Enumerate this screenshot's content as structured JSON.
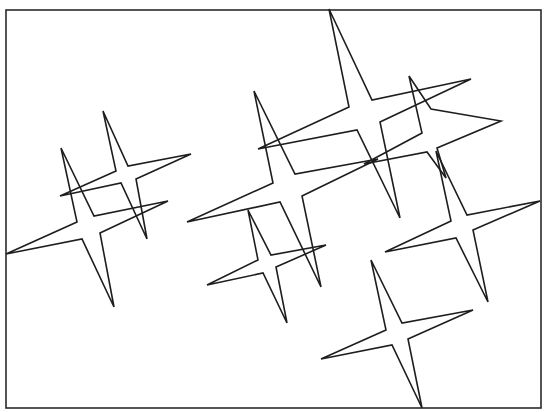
{
  "caption": "",
  "frame": {
    "x": 6,
    "y": 10,
    "width": 535,
    "height": 398,
    "stroke": "#2a2a2a"
  },
  "stroke_color": "#1e1e1e",
  "stars": [
    {
      "id": "star-a",
      "points": [
        [
          61,
          148
        ],
        [
          77,
          222
        ],
        [
          6,
          254
        ],
        [
          82,
          239
        ],
        [
          114,
          307
        ],
        [
          100,
          233
        ],
        [
          168,
          201
        ],
        [
          94,
          216
        ]
      ]
    },
    {
      "id": "star-b",
      "points": [
        [
          103,
          111
        ],
        [
          116,
          171
        ],
        [
          60,
          196
        ],
        [
          121,
          183
        ],
        [
          147,
          239
        ],
        [
          136,
          179
        ],
        [
          191,
          154
        ],
        [
          128,
          166
        ]
      ]
    },
    {
      "id": "star-c",
      "points": [
        [
          254,
          91
        ],
        [
          273,
          183
        ],
        [
          187,
          222
        ],
        [
          280,
          202
        ],
        [
          321,
          287
        ],
        [
          302,
          196
        ],
        [
          378,
          159
        ],
        [
          295,
          174
        ]
      ]
    },
    {
      "id": "star-d",
      "points": [
        [
          248,
          210
        ],
        [
          258,
          260
        ],
        [
          207,
          285
        ],
        [
          263,
          273
        ],
        [
          287,
          323
        ],
        [
          276,
          267
        ],
        [
          326,
          245
        ],
        [
          271,
          255
        ]
      ]
    },
    {
      "id": "star-e",
      "points": [
        [
          329,
          9
        ],
        [
          349,
          107
        ],
        [
          258,
          149
        ],
        [
          357,
          130
        ],
        [
          400,
          218
        ],
        [
          380,
          122
        ],
        [
          471,
          79
        ],
        [
          372,
          100
        ]
      ]
    },
    {
      "id": "star-f",
      "points": [
        [
          409,
          76
        ],
        [
          422,
          133
        ],
        [
          364,
          164
        ],
        [
          427,
          152
        ],
        [
          446,
          178
        ],
        [
          437,
          148
        ],
        [
          501,
          121
        ],
        [
          431,
          109
        ]
      ]
    },
    {
      "id": "star-g",
      "points": [
        [
          436,
          151
        ],
        [
          451,
          221
        ],
        [
          385,
          252
        ],
        [
          456,
          238
        ],
        [
          488,
          302
        ],
        [
          473,
          230
        ],
        [
          540,
          201
        ],
        [
          467,
          215
        ]
      ]
    },
    {
      "id": "star-h",
      "points": [
        [
          371,
          260
        ],
        [
          386,
          330
        ],
        [
          321,
          359
        ],
        [
          392,
          345
        ],
        [
          422,
          408
        ],
        [
          408,
          339
        ],
        [
          473,
          310
        ],
        [
          402,
          323
        ]
      ]
    }
  ]
}
